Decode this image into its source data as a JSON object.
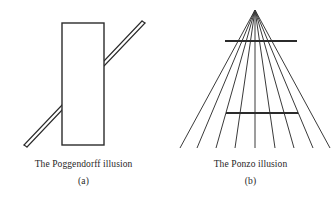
{
  "figure": {
    "background_color": "#ffffff",
    "stroke_color": "#2b2b2b",
    "panels": [
      {
        "id": "poggendorff",
        "caption_title": "The Poggendorff illusion",
        "caption_sub": "(a)",
        "illusion_name": "Poggendorff",
        "elements": {
          "rectangle": {
            "x": 62,
            "y": 23,
            "width": 42,
            "height": 122,
            "fill": "#ffffff",
            "stroke": "#2b2b2b",
            "stroke_width": 1.4
          },
          "diagonal_bar": {
            "description": "thin parallelogram bar crossing behind the rectangle",
            "lower_left_x": 24,
            "lower_left_y": 145,
            "upper_right_x": 142,
            "upper_right_y": 22,
            "thickness": 4,
            "stroke": "#2b2b2b",
            "stroke_width": 1.1
          }
        }
      },
      {
        "id": "ponzo",
        "caption_title": "The Ponzo illusion",
        "caption_sub": "(b)",
        "illusion_name": "Ponzo",
        "elements": {
          "apex": {
            "x": 88,
            "y": 10
          },
          "radiating_lines": {
            "count": 9,
            "bottom_y": 148,
            "bottom_x_positions": [
              13,
              30,
              49,
              68,
              88,
              108,
              127,
              146,
              163
            ],
            "stroke": "#3a3a3a",
            "stroke_width": 1.0
          },
          "horizontal_bars": [
            {
              "name": "upper-bar",
              "x1": 58,
              "x2": 130,
              "y": 41,
              "stroke": "#2b2b2b",
              "stroke_width": 1.8
            },
            {
              "name": "lower-bar",
              "x1": 59,
              "x2": 131,
              "y": 113,
              "stroke": "#2b2b2b",
              "stroke_width": 1.8
            }
          ]
        }
      }
    ]
  }
}
